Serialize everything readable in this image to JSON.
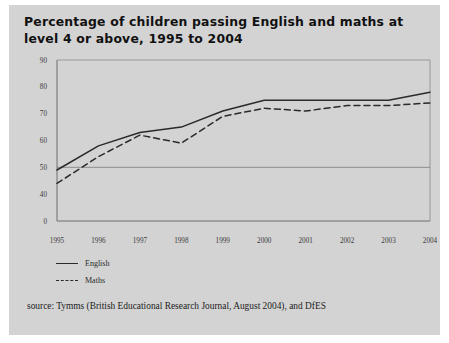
{
  "figure": {
    "title": "Percentage of children passing English and maths at level 4 or above, 1995 to 2004",
    "source": "source: Tymms (British Educational Research Journal, August 2004), and DfES",
    "background_color": "#d3d3d3",
    "line_color": "#2a2a2a"
  },
  "legend": {
    "position": "below-axis-left",
    "entries": [
      {
        "label": "English",
        "style": "solid"
      },
      {
        "label": "Maths",
        "style": "dashed"
      }
    ]
  },
  "chart_data": {
    "type": "line",
    "title": "Percentage of children passing English and maths at level 4 or above, 1995 to 2004",
    "xlabel": "",
    "ylabel": "",
    "categories": [
      "1995",
      "1996",
      "1997",
      "1998",
      "1999",
      "2000",
      "2001",
      "2002",
      "2003",
      "2004"
    ],
    "x": [
      1995,
      1996,
      1997,
      1998,
      1999,
      2000,
      2001,
      2002,
      2003,
      2004
    ],
    "series": [
      {
        "name": "English",
        "style": "solid",
        "values": [
          49,
          58,
          63,
          65,
          71,
          75,
          75,
          75,
          75,
          78
        ]
      },
      {
        "name": "Maths",
        "style": "dashed",
        "values": [
          44,
          54,
          62,
          59,
          69,
          72,
          71,
          73,
          73,
          74
        ]
      }
    ],
    "ytick_labels": [
      "0",
      "40",
      "50",
      "60",
      "70",
      "80",
      "90"
    ],
    "ytick_values": [
      0,
      40,
      50,
      60,
      70,
      80,
      90
    ],
    "ylim": [
      0,
      90
    ],
    "axis_break": true,
    "gridlines": [
      "50"
    ],
    "grid": false,
    "legend_position": "bottom-left"
  }
}
